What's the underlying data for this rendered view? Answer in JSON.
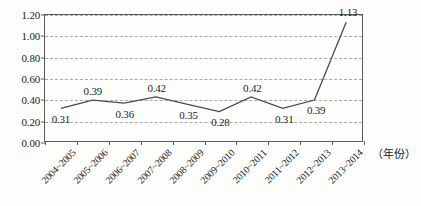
{
  "chart_data": {
    "type": "line",
    "title": "",
    "xlabel": "（年份）",
    "ylabel": "",
    "categories": [
      "2004~2005",
      "2005~2006",
      "2006~2007",
      "2007~2008",
      "2008~2009",
      "2009~2010",
      "2010~2011",
      "2011~2012",
      "2012~2013",
      "2013~2014"
    ],
    "values": [
      0.31,
      0.39,
      0.36,
      0.42,
      0.35,
      0.28,
      0.42,
      0.31,
      0.39,
      1.13
    ],
    "point_labels": [
      "0.31",
      "0.39",
      "0.36",
      "0.42",
      "0.35",
      "0.28",
      "0.42",
      "0.31",
      "0.39",
      "1.13"
    ],
    "label_positions": [
      "below",
      "above",
      "below",
      "above",
      "below",
      "below",
      "above",
      "below",
      "below",
      "above"
    ],
    "ylim": [
      0.0,
      1.2
    ],
    "ytick_step": 0.2,
    "ytick_labels": [
      "0.00",
      "0.20",
      "0.40",
      "0.60",
      "0.80",
      "1.00",
      "1.20"
    ],
    "grid": true,
    "grid_style": "dashed",
    "legend": false,
    "line_color": "#4a4a4a",
    "grid_color": "#a8a8a8",
    "axis_color": "#5a5a5a",
    "text_color": "#1d1d1d"
  }
}
